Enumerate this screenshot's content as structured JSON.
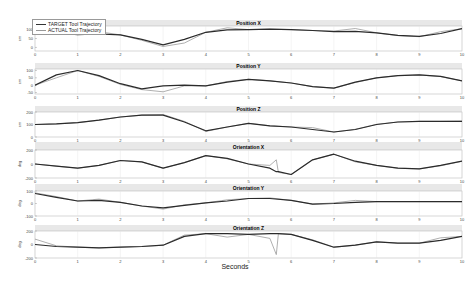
{
  "chart_data": {
    "type": "line",
    "title": "",
    "xlabel": "Seconds",
    "xlim": [
      0,
      10
    ],
    "xticks": [
      0,
      1,
      2,
      3,
      4,
      5,
      6,
      7,
      8,
      9,
      10
    ],
    "grid": true,
    "legend": {
      "position": "top-left",
      "entries": [
        "TARGET Tool Trajectory",
        "ACTUAL Tool Trajectory"
      ]
    },
    "subplots": [
      {
        "title": "Position X",
        "ylabel": "cm",
        "ylim": [
          -20,
          120
        ],
        "yticks": [
          0,
          50,
          100
        ],
        "x": [
          0,
          0.5,
          1,
          1.5,
          2,
          2.5,
          3,
          3.5,
          4,
          4.5,
          5,
          5.5,
          6,
          6.5,
          7,
          7.5,
          8,
          8.5,
          9,
          9.5,
          10
        ],
        "series": [
          {
            "name": "TARGET Tool Trajectory",
            "values": [
              95,
              82,
              72,
              75,
              70,
              45,
              15,
              45,
              85,
              98,
              100,
              102,
              100,
              95,
              88,
              90,
              82,
              68,
              62,
              78,
              105
            ]
          },
          {
            "name": "ACTUAL Tool Trajectory",
            "values": [
              95,
              88,
              72,
              88,
              70,
              40,
              5,
              25,
              85,
              110,
              100,
              102,
              100,
              95,
              92,
              106,
              82,
              66,
              60,
              88,
              105
            ]
          }
        ]
      },
      {
        "title": "Position Y",
        "ylabel": "cm",
        "ylim": [
          -60,
          110
        ],
        "yticks": [
          -50,
          0,
          50,
          100
        ],
        "x": [
          0,
          0.5,
          1,
          1.5,
          2,
          2.5,
          3,
          3.5,
          4,
          4.5,
          5,
          5.5,
          6,
          6.5,
          7,
          7.5,
          8,
          8.5,
          9,
          9.5,
          10
        ],
        "series": [
          {
            "name": "TARGET Tool Trajectory",
            "values": [
              0,
              70,
              100,
              65,
              10,
              -25,
              -5,
              0,
              -5,
              20,
              40,
              30,
              15,
              -10,
              -20,
              20,
              50,
              65,
              70,
              60,
              30
            ]
          },
          {
            "name": "ACTUAL Tool Trajectory",
            "values": [
              0,
              50,
              100,
              60,
              5,
              -30,
              -45,
              -5,
              -5,
              25,
              40,
              30,
              15,
              -10,
              -20,
              18,
              50,
              65,
              70,
              58,
              30
            ]
          }
        ]
      },
      {
        "title": "Position Z",
        "ylabel": "cm",
        "ylim": [
          0,
          200
        ],
        "yticks": [
          0,
          100,
          200
        ],
        "x": [
          0,
          0.5,
          1,
          1.5,
          2,
          2.5,
          3,
          3.5,
          4,
          4.5,
          5,
          5.5,
          6,
          6.5,
          7,
          7.5,
          8,
          8.5,
          9,
          9.5,
          10
        ],
        "series": [
          {
            "name": "TARGET Tool Trajectory",
            "values": [
              100,
              105,
              115,
              135,
              160,
              175,
              175,
              120,
              50,
              80,
              110,
              90,
              80,
              60,
              40,
              60,
              100,
              120,
              125,
              125,
              125
            ]
          },
          {
            "name": "ACTUAL Tool Trajectory",
            "values": [
              100,
              105,
              115,
              135,
              160,
              175,
              180,
              125,
              45,
              80,
              110,
              90,
              80,
              75,
              40,
              62,
              102,
              120,
              125,
              125,
              127
            ]
          }
        ]
      },
      {
        "title": "Orientation X",
        "ylabel": "deg",
        "ylim": [
          -200,
          200
        ],
        "yticks": [
          -200,
          0,
          200
        ],
        "x": [
          0,
          0.5,
          1,
          1.5,
          2,
          2.5,
          3,
          3.5,
          4,
          4.5,
          5,
          5.5,
          5.65,
          5.7,
          6,
          6.5,
          7,
          7.5,
          8,
          8.5,
          9,
          9.5,
          10
        ],
        "series": [
          {
            "name": "TARGET Tool Trajectory",
            "values": [
              0,
              -30,
              -60,
              -20,
              50,
              30,
              -60,
              20,
              120,
              80,
              0,
              -60,
              -110,
              -110,
              -150,
              60,
              140,
              40,
              -20,
              -60,
              -70,
              -20,
              40
            ]
          },
          {
            "name": "ACTUAL Tool Trajectory",
            "values": [
              0,
              -30,
              -60,
              -20,
              50,
              30,
              -60,
              20,
              120,
              75,
              0,
              -20,
              60,
              -120,
              -150,
              60,
              140,
              30,
              -20,
              -60,
              -70,
              -25,
              40
            ]
          }
        ]
      },
      {
        "title": "Orientation Y",
        "ylabel": "deg",
        "ylim": [
          -100,
          100
        ],
        "yticks": [
          -100,
          0,
          100
        ],
        "x": [
          0,
          0.5,
          1,
          1.5,
          2,
          2.5,
          3,
          3.5,
          4,
          4.5,
          5,
          5.5,
          6,
          6.5,
          7,
          7.5,
          8,
          8.5,
          9,
          9.5,
          10
        ],
        "series": [
          {
            "name": "TARGET Tool Trajectory",
            "values": [
              80,
              50,
              20,
              25,
              10,
              -20,
              -35,
              -15,
              5,
              20,
              40,
              40,
              25,
              -5,
              0,
              10,
              15,
              15,
              15,
              15,
              15
            ]
          },
          {
            "name": "ACTUAL Tool Trajectory",
            "values": [
              85,
              55,
              20,
              35,
              10,
              -20,
              -45,
              -10,
              5,
              30,
              40,
              45,
              25,
              -5,
              5,
              25,
              15,
              15,
              15,
              15,
              15
            ]
          }
        ]
      },
      {
        "title": "Orientation Z",
        "ylabel": "deg",
        "ylim": [
          -200,
          200
        ],
        "yticks": [
          -200,
          0,
          200
        ],
        "x": [
          0,
          0.5,
          1,
          1.5,
          2,
          2.5,
          3,
          3.5,
          4,
          4.5,
          5,
          5.5,
          5.65,
          5.7,
          6,
          6.5,
          7,
          7.5,
          8,
          8.5,
          9,
          9.5,
          10
        ],
        "series": [
          {
            "name": "TARGET Tool Trajectory",
            "values": [
              0,
              -30,
              -40,
              -50,
              -40,
              -30,
              -10,
              120,
              160,
              160,
              150,
              160,
              160,
              160,
              150,
              60,
              -40,
              -10,
              40,
              20,
              20,
              60,
              120
            ]
          },
          {
            "name": "ACTUAL Tool Trajectory",
            "values": [
              80,
              -20,
              -40,
              -50,
              -40,
              -30,
              -10,
              140,
              160,
              110,
              150,
              90,
              -150,
              160,
              150,
              70,
              -40,
              -10,
              40,
              20,
              20,
              100,
              120
            ]
          }
        ]
      }
    ]
  },
  "colors": {
    "target": "#2b2b2b",
    "actual": "#9a9a9a",
    "title_band": "#e8e8e8",
    "axes": "#bbbbbb"
  }
}
